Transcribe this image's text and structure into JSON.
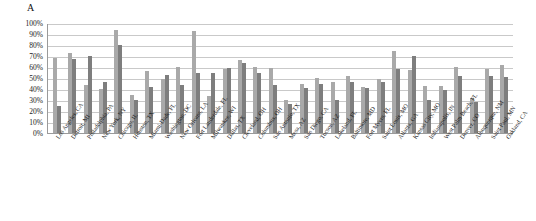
{
  "figure": {
    "panel_label": "A"
  },
  "chart_data": {
    "type": "bar",
    "title": "A",
    "xlabel": "",
    "ylabel": "",
    "ylim": [
      0,
      100
    ],
    "yticks": [
      "0%",
      "10%",
      "20%",
      "30%",
      "40%",
      "50%",
      "60%",
      "70%",
      "80%",
      "90%",
      "100%"
    ],
    "ytick_values": [
      0,
      10,
      20,
      30,
      40,
      50,
      60,
      70,
      80,
      90,
      100
    ],
    "grid": true,
    "legend": "none",
    "categories": [
      "Los Angeles, CA",
      "Detroit, MI",
      "Philadelphia, PA",
      "New York, NY",
      "Chicago, IL",
      "Houston, TX",
      "Miami-Dade, FL",
      "Washington, DC",
      "New Orleans, LA",
      "Fort Lauderdale, FL",
      "Milwaukee, WI",
      "Dallas, TX",
      "Cleveland, OH",
      "Columbus, OH",
      "San Antonio, TX",
      "Mesa, AZ",
      "San Diego, CA",
      "Tucson, AZ",
      "Lakeland, FL",
      "Baltimore, MD",
      "Fort Myers, FL",
      "Saint Louis, MO",
      "Atlanta, GA",
      "Kansas City, MO",
      "Indianapolis, IN",
      "West Palm Beach, FL",
      "Denver, CO",
      "Albuquerque, NM",
      "Saint Paul, MN",
      "Oakland, CA"
    ],
    "series": [
      {
        "name": "Series 1",
        "color": "#a9a9a9",
        "values": [
          68,
          73,
          44,
          40,
          94,
          35,
          56,
          49,
          60,
          93,
          34,
          58,
          66,
          60,
          59,
          30,
          45,
          50,
          46,
          52,
          42,
          49,
          75,
          57,
          43,
          43,
          60,
          32,
          58,
          62
        ]
      },
      {
        "name": "Series 2",
        "color": "#7e7e7e",
        "values": [
          25,
          67,
          70,
          46,
          80,
          30,
          42,
          53,
          44,
          55,
          55,
          59,
          64,
          55,
          44,
          26,
          41,
          45,
          30,
          46,
          41,
          46,
          58,
          70,
          30,
          39,
          52,
          28,
          52,
          51
        ]
      }
    ]
  }
}
